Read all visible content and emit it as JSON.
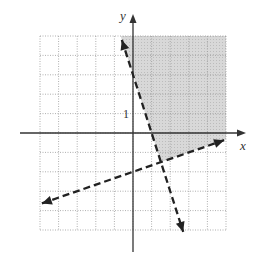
{
  "chart_data": {
    "type": "line",
    "title": "",
    "xlabel": "x",
    "ylabel": "y",
    "xlim": [
      -5,
      5
    ],
    "ylim": [
      -5,
      5
    ],
    "grid": true,
    "tick_labels": [
      {
        "axis": "y",
        "value": 1,
        "label": "1"
      }
    ],
    "series": [
      {
        "name": "boundary-1",
        "equation": "y = -3x + 3",
        "style": "dashed",
        "arrows": "both",
        "points": [
          [
            -0.6,
            4.8
          ],
          [
            1,
            0
          ],
          [
            1.5,
            -1.5
          ],
          [
            2.7,
            -5.1
          ]
        ]
      },
      {
        "name": "boundary-2",
        "equation": "y = x/3 - 2",
        "style": "dashed",
        "arrows": "both",
        "points": [
          [
            -4.9,
            -3.63
          ],
          [
            0,
            -2
          ],
          [
            1.5,
            -1.5
          ],
          [
            4.9,
            -0.37
          ]
        ]
      }
    ],
    "shaded_region": {
      "description": "right of y = -3x + 3 and above y = x/3 - 2",
      "vertex": [
        1.5,
        -1.5
      ],
      "color": "#d4d4d4"
    }
  },
  "labels": {
    "x_axis": "x",
    "y_axis": "y",
    "y_tick": "1"
  }
}
